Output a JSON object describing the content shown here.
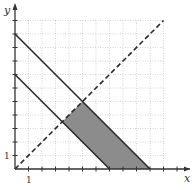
{
  "chart_data": {
    "type": "line",
    "title": "",
    "xlabel": "x",
    "ylabel": "y",
    "xlim": [
      0,
      12
    ],
    "ylim": [
      0,
      12
    ],
    "grid": true,
    "tick_labels": {
      "x": [
        "1"
      ],
      "y": [
        "1"
      ]
    },
    "series": [
      {
        "name": "x + y = 10",
        "style": "solid",
        "points": [
          [
            0,
            10
          ],
          [
            10,
            0
          ]
        ]
      },
      {
        "name": "x + y = 7",
        "style": "solid",
        "points": [
          [
            0,
            7
          ],
          [
            7,
            0
          ]
        ]
      },
      {
        "name": "y = x",
        "style": "dashed",
        "points": [
          [
            0,
            0
          ],
          [
            11,
            11
          ]
        ]
      }
    ],
    "shaded_region": {
      "description": "7 <= x + y <= 10, y <= x, y >= 0",
      "vertices": [
        [
          3.5,
          3.5
        ],
        [
          5,
          5
        ],
        [
          10,
          0
        ],
        [
          7,
          0
        ]
      ],
      "color": "#8c8c8c"
    }
  },
  "axes": {
    "x_label": "x",
    "y_label": "y",
    "x_tick_label": "1",
    "y_tick_label": "1"
  }
}
